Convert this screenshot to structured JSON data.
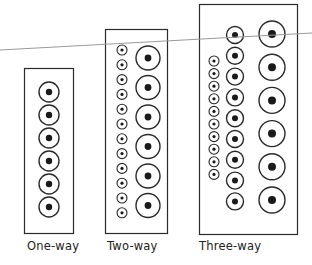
{
  "figure": {
    "background": "#ffffff",
    "stroke_color": "#2a2a2a",
    "reference_line": {
      "color": "#9a9a9a",
      "x1": 0,
      "y1": 50,
      "x2": 312,
      "y2": 33
    },
    "panels": [
      {
        "id": "one-way",
        "label": "One-way",
        "box": {
          "x": 24,
          "y": 68,
          "w": 49,
          "h": 165
        },
        "label_pos": {
          "x": 27,
          "y": 239
        },
        "columns": [
          {
            "size": "medium",
            "cx": 49,
            "r": 10,
            "dot_r": 3.2,
            "count": 6,
            "y_start": 92,
            "y_step": 23
          }
        ]
      },
      {
        "id": "two-way",
        "label": "Two-way",
        "box": {
          "x": 105,
          "y": 29,
          "w": 62,
          "h": 204
        },
        "label_pos": {
          "x": 107,
          "y": 239
        },
        "columns": [
          {
            "size": "small",
            "cx": 122,
            "r": 5,
            "dot_r": 1.6,
            "count": 12,
            "y_start": 50,
            "y_step": 14.8
          },
          {
            "size": "large",
            "cx": 148,
            "r": 12,
            "dot_r": 3.4,
            "count": 6,
            "y_start": 58,
            "y_step": 29.5
          }
        ]
      },
      {
        "id": "three-way",
        "label": "Three-way",
        "box": {
          "x": 199,
          "y": 4,
          "w": 98,
          "h": 230
        },
        "label_pos": {
          "x": 199,
          "y": 239
        },
        "columns": [
          {
            "size": "small",
            "cx": 214,
            "r": 5,
            "dot_r": 1.6,
            "count": 10,
            "y_start": 61,
            "y_step": 12.6
          },
          {
            "size": "medium",
            "cx": 235,
            "r": 8.5,
            "dot_r": 3,
            "count": 9,
            "y_start": 35,
            "y_step": 20.8
          },
          {
            "size": "large",
            "cx": 272,
            "r": 13,
            "dot_r": 4,
            "count": 6,
            "y_start": 34,
            "y_step": 33.2
          }
        ]
      }
    ]
  }
}
